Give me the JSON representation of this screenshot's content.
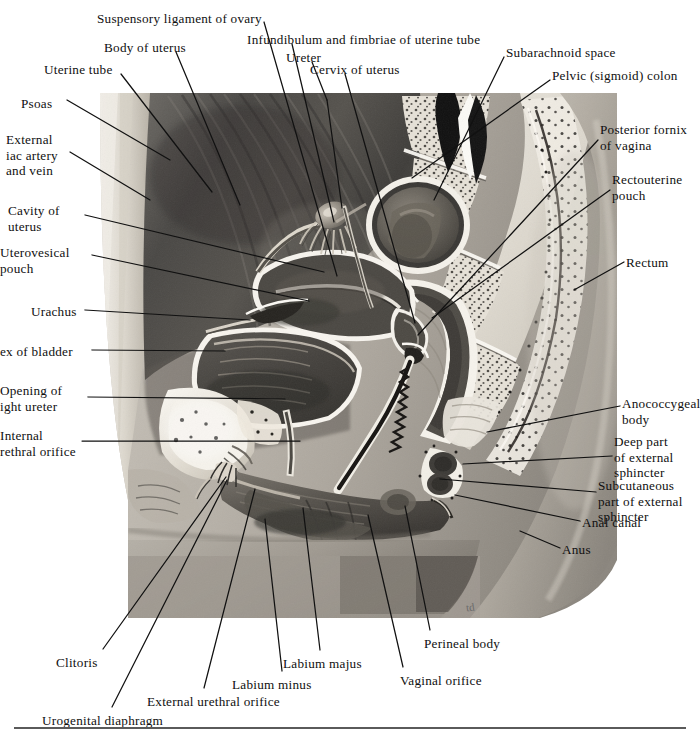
{
  "figure": {
    "signature": "td",
    "photo_bounds": {
      "left": 100,
      "top": 93,
      "right": 617,
      "bottom": 618
    },
    "colors": {
      "leader_line": "#111111",
      "text": "#101010",
      "baseline_rule": "#5a5a5a",
      "background": "#ffffff",
      "muscle_dark": "#4a4a4a",
      "bone_light": "#d8d4cb",
      "cavity_dark": "#3c3c3c",
      "skin_mid": "#a9a49c"
    }
  },
  "labels": [
    {
      "id": "suspensory-ligament-of-ovary",
      "text": "Suspensory ligament of ovary",
      "x": 97,
      "y": 11,
      "align": "left",
      "lines": 1
    },
    {
      "id": "infundibulum-and-fimbriae",
      "text": "Infundibulum and fimbriae of uterine tube",
      "x": 247,
      "y": 32,
      "align": "left",
      "lines": 1
    },
    {
      "id": "body-of-uterus",
      "text": "Body of uterus",
      "x": 104,
      "y": 40,
      "align": "left",
      "lines": 1
    },
    {
      "id": "ureter",
      "text": "Ureter",
      "x": 286,
      "y": 50,
      "align": "left",
      "lines": 1
    },
    {
      "id": "subarachnoid-space",
      "text": "Subarachnoid space",
      "x": 506,
      "y": 45,
      "align": "left",
      "lines": 1
    },
    {
      "id": "uterine-tube",
      "text": "Uterine tube",
      "x": 44,
      "y": 62,
      "align": "left",
      "lines": 1
    },
    {
      "id": "cervix-of-uterus",
      "text": "Cervix of uterus",
      "x": 310,
      "y": 62,
      "align": "left",
      "lines": 1
    },
    {
      "id": "pelvic-sigmoid-colon",
      "text": "Pelvic (sigmoid) colon",
      "x": 552,
      "y": 68,
      "align": "left",
      "lines": 1
    },
    {
      "id": "psoas",
      "text": "Psoas",
      "x": 21,
      "y": 96,
      "align": "left",
      "lines": 1
    },
    {
      "id": "posterior-fornix-of-vagina",
      "text": "Posterior fornix\nof vagina",
      "x": 600,
      "y": 122,
      "align": "left",
      "lines": 2
    },
    {
      "id": "external-iliac-artery-and-vein",
      "text": "External\niac artery\nand vein",
      "x": 6,
      "y": 132,
      "align": "left",
      "lines": 3
    },
    {
      "id": "rectouterine-pouch",
      "text": "Rectouterine\npouch",
      "x": 612,
      "y": 172,
      "align": "left",
      "lines": 2
    },
    {
      "id": "cavity-of-uterus",
      "text": "Cavity of\nuterus",
      "x": 8,
      "y": 203,
      "align": "left",
      "lines": 2
    },
    {
      "id": "uterovesical-pouch",
      "text": "Uterovesical\npouch",
      "x": 0,
      "y": 245,
      "align": "left",
      "lines": 2
    },
    {
      "id": "rectum",
      "text": "Rectum",
      "x": 626,
      "y": 255,
      "align": "left",
      "lines": 1
    },
    {
      "id": "urachus",
      "text": "Urachus",
      "x": 31,
      "y": 304,
      "align": "left",
      "lines": 1
    },
    {
      "id": "apex-of-bladder",
      "text": "ex of bladder",
      "x": 0,
      "y": 344,
      "align": "left",
      "lines": 1
    },
    {
      "id": "opening-of-right-ureter",
      "text": "Opening of\night ureter",
      "x": 0,
      "y": 383,
      "align": "left",
      "lines": 2
    },
    {
      "id": "anococcygeal-body",
      "text": "Anococcygeal\nbody",
      "x": 622,
      "y": 396,
      "align": "left",
      "lines": 2
    },
    {
      "id": "internal-urethral-orifice",
      "text": "Internal\nrethral orifice",
      "x": 0,
      "y": 428,
      "align": "left",
      "lines": 2
    },
    {
      "id": "deep-part-of-external-sphincter",
      "text": "Deep part\nof external\nsphincter",
      "x": 614,
      "y": 434,
      "align": "left",
      "lines": 3
    },
    {
      "id": "subcutaneous-part-of-external-sphincter",
      "text": "Subcutaneous\npart of external\nsphincter",
      "x": 598,
      "y": 478,
      "align": "left",
      "lines": 3
    },
    {
      "id": "anal-canal",
      "text": "Anal canal",
      "x": 582,
      "y": 515,
      "align": "left",
      "lines": 1
    },
    {
      "id": "anus",
      "text": "Anus",
      "x": 562,
      "y": 542,
      "align": "left",
      "lines": 1
    },
    {
      "id": "perineal-body",
      "text": "Perineal body",
      "x": 424,
      "y": 636,
      "align": "left",
      "lines": 1
    },
    {
      "id": "labium-majus",
      "text": "Labium majus",
      "x": 283,
      "y": 656,
      "align": "left",
      "lines": 1
    },
    {
      "id": "clitoris",
      "text": "Clitoris",
      "x": 56,
      "y": 655,
      "align": "left",
      "lines": 1
    },
    {
      "id": "labium-minus",
      "text": "Labium minus",
      "x": 232,
      "y": 677,
      "align": "left",
      "lines": 1
    },
    {
      "id": "vaginal-orifice",
      "text": "Vaginal orifice",
      "x": 400,
      "y": 673,
      "align": "left",
      "lines": 1
    },
    {
      "id": "external-urethral-orifice",
      "text": "External urethral orifice",
      "x": 147,
      "y": 694,
      "align": "left",
      "lines": 1
    },
    {
      "id": "urogenital-diaphragm",
      "text": "Urogenital diaphragm",
      "x": 42,
      "y": 713,
      "align": "left",
      "lines": 1
    }
  ],
  "leaders": [
    {
      "id": "leader-suspensory-ligament-of-ovary",
      "points": "264,22 337,276"
    },
    {
      "id": "leader-infundibulum-and-fimbriae",
      "points": "292,44 334,222"
    },
    {
      "id": "leader-body-of-uterus",
      "points": "176,52 240,205"
    },
    {
      "id": "leader-ureter",
      "points": "312,62 327,100"
    },
    {
      "id": "leader-ureter2",
      "points": "327,100 342,208"
    },
    {
      "id": "leader-subarachnoid-space",
      "points": "504,57 434,200"
    },
    {
      "id": "leader-uterine-tube",
      "points": "121,74 212,192"
    },
    {
      "id": "leader-cervix-of-uterus",
      "points": "345,74 415,323"
    },
    {
      "id": "leader-pelvic-sigmoid-colon",
      "points": "550,80 412,178"
    },
    {
      "id": "leader-psoas",
      "points": "67,100 170,160"
    },
    {
      "id": "leader-posterior-fornix-of-vagina",
      "points": "598,140 418,335"
    },
    {
      "id": "leader-external-iliac-artery",
      "points": "70,152 150,200"
    },
    {
      "id": "leader-rectouterine-pouch",
      "points": "610,190 432,318"
    },
    {
      "id": "leader-cavity-of-uterus",
      "points": "85,215 324,272"
    },
    {
      "id": "leader-uterovesical-pouch",
      "points": "92,255 309,301"
    },
    {
      "id": "leader-rectum",
      "points": "624,262 574,290"
    },
    {
      "id": "leader-urachus",
      "points": "85,310 250,320"
    },
    {
      "id": "leader-apex-of-bladder",
      "points": "92,350 225,351"
    },
    {
      "id": "leader-opening-of-right-ureter",
      "points": "88,397 285,399"
    },
    {
      "id": "leader-anococcygeal-body",
      "points": "620,406 487,432"
    },
    {
      "id": "leader-internal-urethral-orifice",
      "points": "82,441 300,441"
    },
    {
      "id": "leader-deep-part-ext-sphincter",
      "points": "612,456 463,464"
    },
    {
      "id": "leader-subcut-part-ext-sphincter",
      "points": "596,492 440,479"
    },
    {
      "id": "leader-anal-canal",
      "points": "580,521 455,495"
    },
    {
      "id": "leader-anus",
      "points": "560,548 520,531"
    },
    {
      "id": "leader-perineal-body",
      "points": "430,630 405,506"
    },
    {
      "id": "leader-labium-majus",
      "points": "320,650 303,508"
    },
    {
      "id": "leader-clitoris",
      "points": "103,649 226,477"
    },
    {
      "id": "leader-labium-minus",
      "points": "282,671 265,519"
    },
    {
      "id": "leader-vaginal-orifice",
      "points": "403,667 368,515"
    },
    {
      "id": "leader-external-urethral-orifice",
      "points": "204,688 255,489"
    },
    {
      "id": "leader-urogenital-diaphragm",
      "points": "112,707 227,480"
    }
  ]
}
